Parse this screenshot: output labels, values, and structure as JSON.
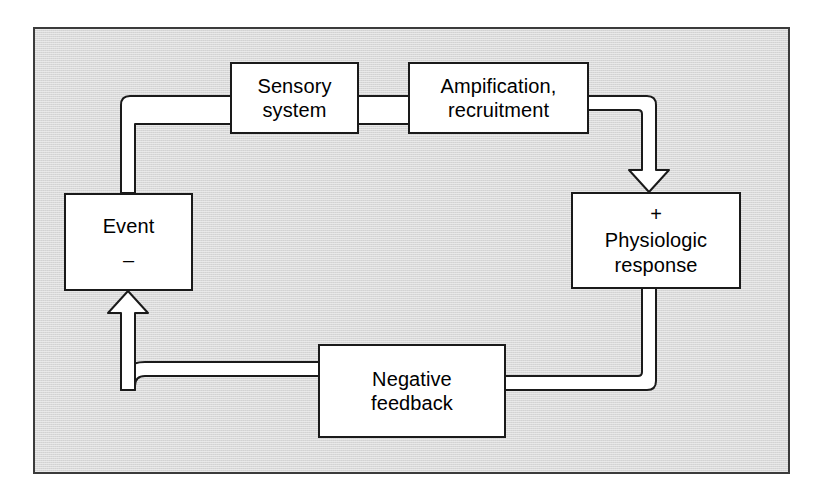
{
  "figure": {
    "kind": "flow-diagram",
    "panel_background": "#d9d9d9",
    "panel_border_color": "#3b3b3b",
    "node_fill": "#ffffff",
    "line_color": "#1a1a1a"
  },
  "nodes": {
    "event": {
      "label": "Event",
      "sign": "–",
      "name": "event-node"
    },
    "sensory": {
      "label": "Sensory\nsystem",
      "name": "sensory-system-node"
    },
    "amplification": {
      "label": "Ampification,\nrecruitment",
      "name": "amplification-recruitment-node"
    },
    "physiologic": {
      "label": "Physiologic\nresponse",
      "sign": "+",
      "name": "physiologic-response-node"
    },
    "negative_feedback": {
      "label": "Negative\nfeedback",
      "name": "negative-feedback-node"
    }
  },
  "connectors": [
    {
      "id": "event-to-sensory",
      "from": "event",
      "to": "sensory",
      "arrowhead": false,
      "style": "double-line-ribbon"
    },
    {
      "id": "sensory-to-amplification",
      "from": "sensory",
      "to": "amplification",
      "arrowhead": false,
      "style": "double-line-ribbon"
    },
    {
      "id": "amplification-to-physiologic",
      "from": "amplification",
      "to": "physiologic",
      "arrowhead": true,
      "style": "double-line-ribbon"
    },
    {
      "id": "physiologic-to-negative-feedback",
      "from": "physiologic",
      "to": "negative_feedback",
      "arrowhead": false,
      "style": "double-line-ribbon"
    },
    {
      "id": "negative-feedback-to-event",
      "from": "negative_feedback",
      "to": "event",
      "arrowhead": true,
      "style": "double-line-ribbon"
    }
  ]
}
